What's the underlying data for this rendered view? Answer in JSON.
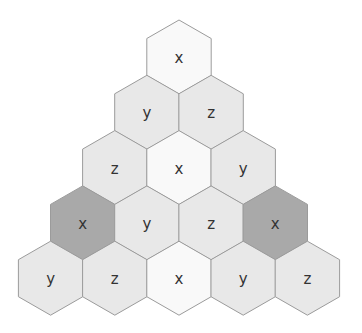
{
  "diagram": {
    "title": "",
    "fills": {
      "white": "#f9f9f9",
      "light": "#e8e8e8",
      "dark": "#a9a9a9"
    },
    "stroke": "#9b9b9b",
    "rows": [
      {
        "cells": [
          {
            "label": "x",
            "shade": "white"
          }
        ]
      },
      {
        "cells": [
          {
            "label": "y",
            "shade": "light"
          },
          {
            "label": "z",
            "shade": "light"
          }
        ]
      },
      {
        "cells": [
          {
            "label": "z",
            "shade": "light"
          },
          {
            "label": "x",
            "shade": "white"
          },
          {
            "label": "y",
            "shade": "light"
          }
        ]
      },
      {
        "cells": [
          {
            "label": "x",
            "shade": "dark"
          },
          {
            "label": "y",
            "shade": "light"
          },
          {
            "label": "z",
            "shade": "light"
          },
          {
            "label": "x",
            "shade": "dark"
          }
        ]
      },
      {
        "cells": [
          {
            "label": "y",
            "shade": "light"
          },
          {
            "label": "z",
            "shade": "light"
          },
          {
            "label": "x",
            "shade": "white"
          },
          {
            "label": "y",
            "shade": "light"
          },
          {
            "label": "z",
            "shade": "light"
          }
        ]
      }
    ]
  }
}
